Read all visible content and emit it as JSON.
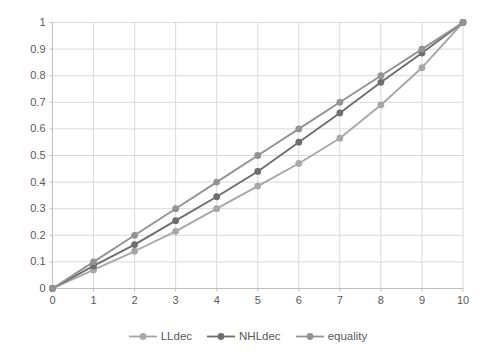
{
  "chart_data": {
    "type": "line",
    "title": "",
    "xlabel": "",
    "ylabel": "",
    "x": [
      0,
      1,
      2,
      3,
      4,
      5,
      6,
      7,
      8,
      9,
      10
    ],
    "series": [
      {
        "name": "LLdec",
        "color": "#a8a8a8",
        "marker": "circle",
        "values": [
          0,
          0.07,
          0.14,
          0.215,
          0.3,
          0.385,
          0.47,
          0.565,
          0.69,
          0.83,
          1.0
        ]
      },
      {
        "name": "NHLdec",
        "color": "#6e6e6e",
        "marker": "circle",
        "values": [
          0,
          0.085,
          0.165,
          0.255,
          0.345,
          0.44,
          0.55,
          0.66,
          0.775,
          0.885,
          1.0
        ]
      },
      {
        "name": "equality",
        "color": "#939393",
        "marker": "circle",
        "values": [
          0,
          0.1,
          0.2,
          0.3,
          0.4,
          0.5,
          0.6,
          0.7,
          0.8,
          0.9,
          1.0
        ]
      }
    ],
    "xlim": [
      0,
      10
    ],
    "ylim": [
      0,
      1
    ],
    "x_tick_labels": [
      "0",
      "1",
      "2",
      "3",
      "4",
      "5",
      "6",
      "7",
      "8",
      "9",
      "10"
    ],
    "y_tick_labels": [
      "0",
      "0.1",
      "0.2",
      "0.3",
      "0.4",
      "0.5",
      "0.6",
      "0.7",
      "0.8",
      "0.9",
      "1"
    ],
    "grid": true,
    "grid_color": "#d9d9d9",
    "axis_color": "#bfbfbf",
    "tick_label_color": "#595959",
    "legend_position": "bottom"
  }
}
